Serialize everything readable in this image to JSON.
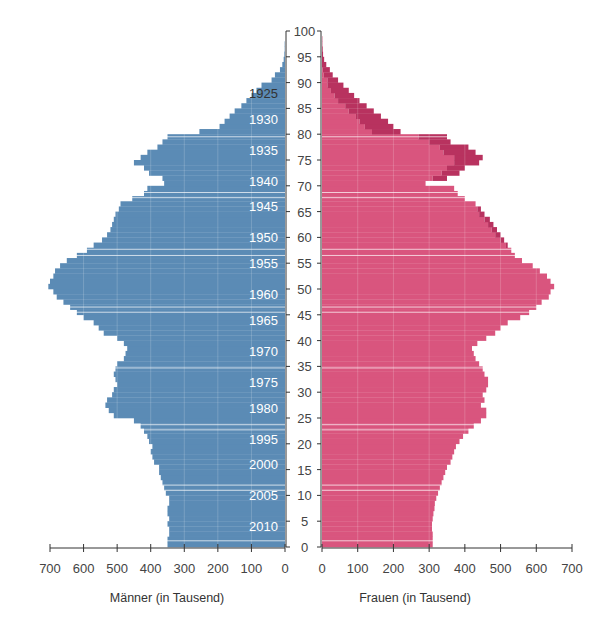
{
  "chart_data": {
    "type": "bar",
    "subtype": "population-pyramid",
    "title": "",
    "left_xlabel": "Männer (in Tausend)",
    "right_xlabel": "Frauen (in Tausend)",
    "ylabel": "",
    "xlim": [
      0,
      700
    ],
    "ylim": [
      0,
      100
    ],
    "x_ticks": [
      0,
      100,
      200,
      300,
      400,
      500,
      600,
      700
    ],
    "x_tick_labels": [
      "0",
      "100",
      "200",
      "300",
      "400",
      "500",
      "600",
      "700"
    ],
    "y_ticks": [
      0,
      5,
      10,
      15,
      20,
      25,
      30,
      35,
      40,
      45,
      50,
      55,
      60,
      65,
      70,
      75,
      80,
      85,
      90,
      95,
      100
    ],
    "y_tick_labels": [
      "0",
      "5",
      "10",
      "15",
      "20",
      "25",
      "30",
      "35",
      "40",
      "45",
      "50",
      "55",
      "60",
      "65",
      "70",
      "75",
      "80",
      "85",
      "90",
      "95",
      "100"
    ],
    "birth_year_labels": [
      {
        "label": "1925",
        "age": 88
      },
      {
        "label": "1930",
        "age": 83
      },
      {
        "label": "1935",
        "age": 77
      },
      {
        "label": "1940",
        "age": 71
      },
      {
        "label": "1945",
        "age": 66
      },
      {
        "label": "1950",
        "age": 60
      },
      {
        "label": "1955",
        "age": 55
      },
      {
        "label": "1960",
        "age": 49
      },
      {
        "label": "1965",
        "age": 44
      },
      {
        "label": "1970",
        "age": 38
      },
      {
        "label": "1975",
        "age": 32
      },
      {
        "label": "1980",
        "age": 27
      },
      {
        "label": "1995",
        "age": 21
      },
      {
        "label": "2000",
        "age": 16
      },
      {
        "label": "2005",
        "age": 10
      },
      {
        "label": "2010",
        "age": 4
      }
    ],
    "ages": [
      0,
      1,
      2,
      3,
      4,
      5,
      6,
      7,
      8,
      9,
      10,
      11,
      12,
      13,
      14,
      15,
      16,
      17,
      18,
      19,
      20,
      21,
      22,
      23,
      24,
      25,
      26,
      27,
      28,
      29,
      30,
      31,
      32,
      33,
      34,
      35,
      36,
      37,
      38,
      39,
      40,
      41,
      42,
      43,
      44,
      45,
      46,
      47,
      48,
      49,
      50,
      51,
      52,
      53,
      54,
      55,
      56,
      57,
      58,
      59,
      60,
      61,
      62,
      63,
      64,
      65,
      66,
      67,
      68,
      69,
      70,
      71,
      72,
      73,
      74,
      75,
      76,
      77,
      78,
      79,
      80,
      81,
      82,
      83,
      84,
      85,
      86,
      87,
      88,
      89,
      90,
      91,
      92,
      93,
      94,
      95,
      96,
      97,
      98,
      99
    ],
    "series": [
      {
        "name": "Männer",
        "side": "left",
        "color": "#5b8bb5",
        "values": [
          350,
          350,
          345,
          345,
          350,
          345,
          350,
          350,
          345,
          345,
          355,
          360,
          365,
          370,
          375,
          375,
          390,
          395,
          400,
          395,
          405,
          410,
          420,
          430,
          450,
          510,
          525,
          535,
          530,
          515,
          510,
          500,
          505,
          510,
          505,
          500,
          480,
          475,
          470,
          480,
          500,
          540,
          555,
          570,
          600,
          620,
          640,
          660,
          680,
          690,
          705,
          700,
          690,
          685,
          670,
          650,
          620,
          590,
          570,
          545,
          530,
          520,
          515,
          510,
          505,
          495,
          490,
          455,
          420,
          410,
          360,
          365,
          405,
          420,
          450,
          430,
          410,
          380,
          365,
          350,
          255,
          195,
          180,
          165,
          150,
          130,
          115,
          100,
          85,
          70,
          40,
          30,
          15,
          8,
          4,
          2,
          1,
          1,
          0,
          0
        ]
      },
      {
        "name": "Frauen",
        "side": "right",
        "color": "#d9557e",
        "values": [
          310,
          310,
          310,
          308,
          308,
          310,
          312,
          315,
          316,
          320,
          325,
          330,
          335,
          340,
          345,
          350,
          360,
          365,
          370,
          375,
          385,
          395,
          410,
          425,
          445,
          460,
          460,
          445,
          455,
          450,
          460,
          465,
          465,
          455,
          450,
          440,
          430,
          425,
          420,
          435,
          460,
          485,
          500,
          520,
          555,
          580,
          600,
          615,
          635,
          640,
          650,
          640,
          630,
          610,
          590,
          560,
          540,
          530,
          520,
          510,
          500,
          490,
          480,
          470,
          455,
          445,
          430,
          400,
          380,
          370,
          290,
          350,
          385,
          400,
          440,
          450,
          430,
          410,
          360,
          350,
          220,
          200,
          185,
          165,
          145,
          125,
          105,
          90,
          75,
          60,
          45,
          30,
          22,
          12,
          6,
          3,
          2,
          1,
          1,
          0
        ]
      },
      {
        "name": "Frauenüberschuss",
        "side": "right",
        "color": "#b8325f",
        "values": [
          0,
          0,
          0,
          0,
          0,
          0,
          0,
          0,
          0,
          0,
          0,
          0,
          0,
          0,
          0,
          0,
          0,
          0,
          0,
          0,
          0,
          0,
          0,
          0,
          0,
          0,
          0,
          0,
          0,
          0,
          0,
          0,
          0,
          0,
          0,
          0,
          0,
          0,
          0,
          0,
          0,
          0,
          0,
          0,
          0,
          0,
          0,
          0,
          0,
          0,
          0,
          0,
          0,
          0,
          0,
          0,
          0,
          0,
          5,
          10,
          15,
          15,
          15,
          15,
          15,
          10,
          0,
          0,
          0,
          0,
          0,
          40,
          50,
          50,
          70,
          80,
          90,
          80,
          60,
          80,
          80,
          80,
          80,
          70,
          70,
          60,
          60,
          55,
          50,
          45,
          30,
          25,
          20,
          12,
          6,
          3,
          2,
          1,
          1,
          0
        ]
      }
    ],
    "legend": "none",
    "grid": false
  }
}
